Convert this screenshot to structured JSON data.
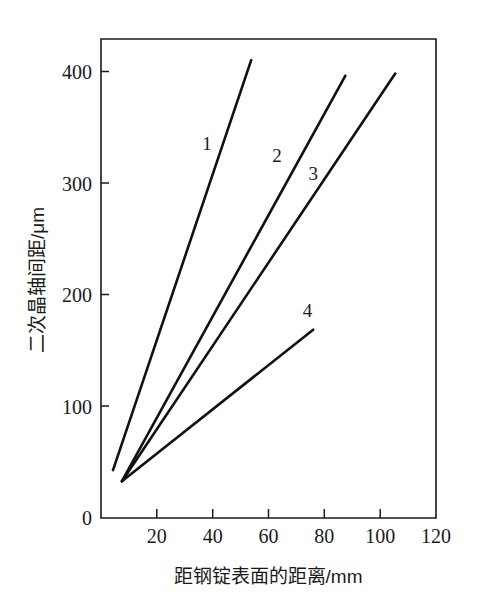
{
  "chart_data": {
    "type": "line",
    "title": "",
    "xlabel": "距钢锭表面的距离/mm",
    "ylabel": "二次晶轴间距/μm",
    "xlim": [
      0,
      120
    ],
    "ylim": [
      0,
      430
    ],
    "xticks": [
      0,
      20,
      40,
      60,
      80,
      100,
      120
    ],
    "xtick_labels": [
      "0",
      "20",
      "40",
      "60",
      "80",
      "100",
      "120"
    ],
    "yticks": [
      0,
      100,
      200,
      300,
      400
    ],
    "ytick_labels": [
      "0",
      "100",
      "200",
      "300",
      "400"
    ],
    "grid": false,
    "legend": "inline-curve-labels",
    "series": [
      {
        "name": "1",
        "label": "1",
        "label_x": 38,
        "label_y": 330,
        "x": [
          4.3,
          53.8
        ],
        "y": [
          43,
          411
        ]
      },
      {
        "name": "2",
        "label": "2",
        "label_x": 63,
        "label_y": 320,
        "x": [
          7.5,
          87.5
        ],
        "y": [
          33,
          397
        ]
      },
      {
        "name": "3",
        "label": "3",
        "label_x": 76,
        "label_y": 303,
        "x": [
          7.5,
          105.4
        ],
        "y": [
          33,
          399
        ]
      },
      {
        "name": "4",
        "label": "4",
        "label_x": 74,
        "label_y": 180,
        "x": [
          7.5,
          76.0
        ],
        "y": [
          33,
          169
        ]
      }
    ],
    "colors": {
      "curve": "#111111",
      "axis": "#1a1a1a",
      "background": "#ffffff"
    }
  },
  "axis": {
    "x_title": "距钢锭表面的距离/mm",
    "y_title": "二次晶轴间距/μm"
  },
  "ticks": {
    "x": [
      "0",
      "20",
      "40",
      "60",
      "80",
      "100",
      "120"
    ],
    "y": [
      "0",
      "100",
      "200",
      "300",
      "400"
    ]
  },
  "curve_labels": [
    "1",
    "2",
    "3",
    "4"
  ]
}
